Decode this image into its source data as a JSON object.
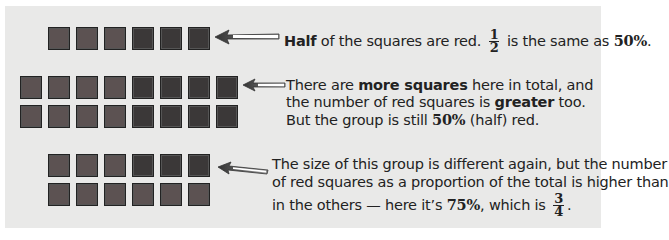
{
  "colors": {
    "background": "#e9e9e8",
    "red_square": "#5c5252",
    "dark_square": "#3b3838",
    "text": "#222222"
  },
  "groups": [
    {
      "id": "group-1",
      "rows": [
        [
          "red",
          "red",
          "red",
          "dark",
          "dark",
          "dark"
        ]
      ],
      "total": 6,
      "red": 3,
      "percent": "50%",
      "fraction": {
        "num": "1",
        "den": "2"
      },
      "caption": {
        "bold_lead": "Half",
        "part1": " of the squares are red.",
        "part2": " is the same as ",
        "bold_percent": "50%",
        "end": "."
      }
    },
    {
      "id": "group-2",
      "rows": [
        [
          "red",
          "red",
          "red",
          "red",
          "dark",
          "dark",
          "dark",
          "dark"
        ],
        [
          "red",
          "red",
          "red",
          "red",
          "dark",
          "dark",
          "dark",
          "dark"
        ]
      ],
      "total": 16,
      "red": 8,
      "percent": "50%",
      "caption": {
        "line1_a": "There are ",
        "line1_bold": "more squares",
        "line1_b": " here in total, and",
        "line2_a": "the number of red squares is ",
        "line2_bold": "greater",
        "line2_b": " too.",
        "line3_a": "But the group is still ",
        "line3_bold": "50%",
        "line3_b": " (half) red."
      }
    },
    {
      "id": "group-3",
      "rows": [
        [
          "red",
          "red",
          "red",
          "dark",
          "dark",
          "dark"
        ],
        [
          "red",
          "red",
          "red",
          "red",
          "red",
          "red"
        ]
      ],
      "total": 12,
      "red": 9,
      "percent": "75%",
      "fraction": {
        "num": "3",
        "den": "4"
      },
      "caption": {
        "line1": "The size of this group is different again, but the number",
        "line2": "of red squares as a proportion of the total is higher than",
        "line3_a": "in the others — here it’s ",
        "line3_bold": "75%",
        "line3_b": ", which is ",
        "line3_end": "."
      }
    }
  ]
}
